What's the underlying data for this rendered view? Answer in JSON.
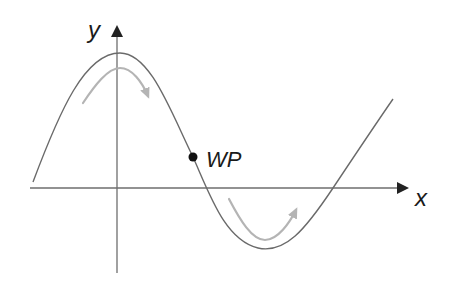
{
  "diagram": {
    "type": "function-graph",
    "axes": {
      "x_label": "x",
      "y_label": "y"
    },
    "point_label": "WP",
    "colors": {
      "axis": "#6e6e6e",
      "curve": "#6a6a6a",
      "curvature_arrows": "#b4b4b4",
      "point": "#111111",
      "text": "#1a1a1a"
    },
    "annotations": [
      {
        "name": "right-curvature-arrow",
        "meaning": "concave down (right curve)"
      },
      {
        "name": "left-curvature-arrow",
        "meaning": "concave up (left curve)"
      }
    ]
  }
}
